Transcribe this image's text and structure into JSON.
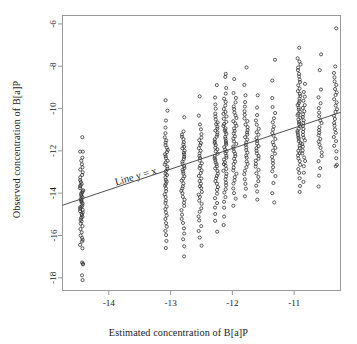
{
  "figure": {
    "background": "#ffffff",
    "frame_color": "#9a9a9a",
    "point_color": "#2a2a2a",
    "line_color": "#3d3d3d",
    "text_color": "#1b1b1b"
  },
  "chart_data": {
    "type": "scatter",
    "title": "",
    "xlabel": "Estimated concentration of B[a]P",
    "ylabel": "Observed concentration of B[a]P",
    "xlim": [
      -14.75,
      -10.25
    ],
    "ylim": [
      -18.6,
      -5.6
    ],
    "xticks": [
      -14,
      -13,
      -12,
      -11
    ],
    "xticklabels": [
      "-14",
      "-13",
      "-12",
      "-11"
    ],
    "yticks": [
      -6,
      -8,
      -10,
      -12,
      -14,
      -16,
      -18
    ],
    "yticklabels": [
      "-6",
      "-8",
      "-10",
      "-12",
      "-14",
      "-16",
      "-18"
    ],
    "grid": false,
    "legend": null,
    "marker": "open-circle",
    "marker_size_px": 3.0,
    "annotations": [
      {
        "text": "Line y = x",
        "x": -13.55,
        "y": -13.35,
        "rotation_deg": -16
      }
    ],
    "reference_line": {
      "label": "Line y = x",
      "x0": -14.75,
      "y0": -14.57,
      "x1": -10.25,
      "y1": -10.18,
      "style": "solid",
      "width_px": 0.9
    },
    "series": [
      {
        "name": "observations",
        "columns": [
          {
            "x": -14.44,
            "values": [
              -11.34,
              -12.02,
              -12.05,
              -12.32,
              -12.46,
              -12.62,
              -12.78,
              -12.9,
              -13.02,
              -13.14,
              -13.26,
              -13.36,
              -13.46,
              -13.55,
              -13.62,
              -13.7,
              -13.78,
              -13.84,
              -13.9,
              -13.96,
              -14.02,
              -14.08,
              -14.14,
              -14.2,
              -14.26,
              -14.32,
              -14.38,
              -14.44,
              -14.5,
              -14.56,
              -14.62,
              -14.68,
              -14.74,
              -14.8,
              -14.86,
              -14.92,
              -14.98,
              -15.04,
              -15.1,
              -15.18,
              -15.26,
              -15.34,
              -15.44,
              -15.56,
              -15.7,
              -15.86,
              -16.0,
              -16.12,
              -16.2,
              -16.3,
              -16.44,
              -16.62,
              -17.26,
              -17.32,
              -17.38,
              -17.9,
              -18.1
            ]
          },
          {
            "x": -13.07,
            "values": [
              -9.62,
              -10.1,
              -10.58,
              -10.92,
              -11.16,
              -11.34,
              -11.5,
              -11.62,
              -11.74,
              -11.86,
              -11.96,
              -12.06,
              -12.16,
              -12.26,
              -12.36,
              -12.46,
              -12.56,
              -12.66,
              -12.76,
              -12.86,
              -12.96,
              -13.06,
              -13.16,
              -13.26,
              -13.36,
              -13.46,
              -13.56,
              -13.66,
              -13.78,
              -13.92,
              -14.06,
              -14.2,
              -14.34,
              -14.48,
              -14.62,
              -14.76,
              -14.9,
              -15.06,
              -15.22,
              -15.4,
              -15.58,
              -15.78,
              -16.0,
              -16.26,
              -16.6
            ]
          },
          {
            "x": -12.8,
            "values": [
              -10.42,
              -11.1,
              -11.22,
              -11.34,
              -11.46,
              -11.58,
              -11.7,
              -11.8,
              -11.9,
              -12.0,
              -12.1,
              -12.2,
              -12.3,
              -12.4,
              -12.5,
              -12.6,
              -12.7,
              -12.8,
              -12.9,
              -13.0,
              -13.1,
              -13.2,
              -13.3,
              -13.42,
              -13.54,
              -13.66,
              -13.78,
              -13.9,
              -14.02,
              -14.16,
              -14.3,
              -14.46,
              -14.62,
              -14.8,
              -15.0,
              -15.2,
              -15.42,
              -15.66,
              -15.9,
              -16.16,
              -16.5,
              -17.0
            ]
          },
          {
            "x": -12.52,
            "values": [
              -9.42,
              -10.34,
              -10.74,
              -11.0,
              -11.2,
              -11.36,
              -11.5,
              -11.62,
              -11.74,
              -11.86,
              -11.98,
              -12.1,
              -12.22,
              -12.34,
              -12.46,
              -12.58,
              -12.7,
              -12.82,
              -12.94,
              -13.06,
              -13.18,
              -13.3,
              -13.42,
              -13.54,
              -13.66,
              -13.78,
              -13.92,
              -14.06,
              -14.2,
              -14.36,
              -14.52,
              -14.7,
              -14.9,
              -15.1,
              -15.3,
              -15.54,
              -15.8,
              -16.1,
              -16.46
            ]
          },
          {
            "x": -12.26,
            "values": [
              -8.9,
              -9.5,
              -9.82,
              -10.02,
              -10.22,
              -10.38,
              -10.52,
              -10.64,
              -10.74,
              -10.84,
              -10.94,
              -11.04,
              -11.14,
              -11.24,
              -11.34,
              -11.44,
              -11.54,
              -11.64,
              -11.74,
              -11.84,
              -11.94,
              -12.04,
              -12.14,
              -12.24,
              -12.34,
              -12.44,
              -12.54,
              -12.64,
              -12.74,
              -12.84,
              -12.94,
              -13.06,
              -13.18,
              -13.3,
              -13.42,
              -13.56,
              -13.7,
              -13.86,
              -14.04,
              -14.24,
              -14.46,
              -14.7,
              -14.98,
              -15.32,
              -15.8
            ]
          },
          {
            "x": -12.12,
            "values": [
              -8.34,
              -8.5,
              -9.04,
              -9.3,
              -9.52,
              -9.7,
              -9.86,
              -10.0,
              -10.14,
              -10.26,
              -10.38,
              -10.5,
              -10.62,
              -10.72,
              -10.82,
              -10.92,
              -11.02,
              -11.12,
              -11.22,
              -11.32,
              -11.42,
              -11.52,
              -11.62,
              -11.72,
              -11.82,
              -11.92,
              -12.02,
              -12.12,
              -12.22,
              -12.32,
              -12.42,
              -12.52,
              -12.62,
              -12.72,
              -12.84,
              -12.96,
              -13.08,
              -13.2,
              -13.34,
              -13.48,
              -13.64,
              -13.8,
              -13.98,
              -14.18,
              -14.4,
              -14.68,
              -15.1,
              -15.5
            ]
          },
          {
            "x": -11.96,
            "values": [
              -8.62,
              -9.26,
              -9.5,
              -9.7,
              -9.88,
              -10.04,
              -10.18,
              -10.32,
              -10.46,
              -10.58,
              -10.7,
              -10.82,
              -10.94,
              -11.06,
              -11.18,
              -11.3,
              -11.42,
              -11.54,
              -11.66,
              -11.78,
              -11.9,
              -12.02,
              -12.14,
              -12.26,
              -12.38,
              -12.5,
              -12.64,
              -12.78,
              -12.92,
              -13.06,
              -13.22,
              -13.38,
              -13.56,
              -13.76,
              -13.98,
              -14.24,
              -14.6
            ]
          },
          {
            "x": -11.78,
            "values": [
              -8.04,
              -8.88,
              -9.36,
              -9.68,
              -9.92,
              -10.12,
              -10.3,
              -10.46,
              -10.6,
              -10.74,
              -10.88,
              -11.0,
              -11.12,
              -11.24,
              -11.36,
              -11.48,
              -11.6,
              -11.72,
              -11.84,
              -11.96,
              -12.08,
              -12.2,
              -12.34,
              -12.48,
              -12.62,
              -12.78,
              -12.94,
              -13.12,
              -13.32,
              -13.54,
              -13.8,
              -14.14
            ]
          },
          {
            "x": -11.6,
            "values": [
              -9.38,
              -9.96,
              -10.3,
              -10.56,
              -10.76,
              -10.94,
              -11.1,
              -11.24,
              -11.38,
              -11.52,
              -11.64,
              -11.76,
              -11.88,
              -12.0,
              -12.12,
              -12.24,
              -12.36,
              -12.48,
              -12.62,
              -12.76,
              -12.9,
              -13.06,
              -13.22,
              -13.42,
              -13.64,
              -13.92,
              -14.3
            ]
          },
          {
            "x": -11.33,
            "values": [
              -7.7,
              -8.66,
              -9.5,
              -9.92,
              -10.22,
              -10.46,
              -10.66,
              -10.84,
              -11.0,
              -11.16,
              -11.3,
              -11.44,
              -11.58,
              -11.72,
              -11.86,
              -12.0,
              -12.14,
              -12.28,
              -12.44,
              -12.6,
              -12.78,
              -12.98,
              -13.2,
              -13.5,
              -14.02,
              -14.42
            ]
          },
          {
            "x": -10.92,
            "values": [
              -7.12,
              -7.62,
              -7.78,
              -7.92,
              -8.06,
              -8.2,
              -8.34,
              -8.48,
              -8.62,
              -8.76,
              -8.9,
              -9.04,
              -9.18,
              -9.3,
              -9.42,
              -9.54,
              -9.64,
              -9.74,
              -9.84,
              -9.94,
              -10.04,
              -10.14,
              -10.24,
              -10.34,
              -10.44,
              -10.54,
              -10.64,
              -10.74,
              -10.84,
              -10.94,
              -11.04,
              -11.14,
              -11.24,
              -11.34,
              -11.44,
              -11.54,
              -11.64,
              -11.74,
              -11.86,
              -11.98,
              -12.1,
              -12.22,
              -12.36,
              -12.5,
              -12.66,
              -12.84,
              -13.04,
              -13.3,
              -13.66,
              -13.92
            ]
          },
          {
            "x": -10.85,
            "values": [
              -8.84,
              -9.2,
              -9.44,
              -9.64,
              -9.82,
              -9.98,
              -10.12,
              -10.26,
              -10.4,
              -10.54,
              -10.68,
              -10.82,
              -10.96,
              -11.1,
              -11.24,
              -11.38,
              -11.52,
              -11.66,
              -11.8,
              -11.96,
              -12.12,
              -12.3,
              -12.5,
              -12.74,
              -13.04,
              -13.46
            ]
          },
          {
            "x": -10.58,
            "values": [
              -7.42,
              -8.18,
              -9.08,
              -9.46,
              -9.74,
              -9.98,
              -10.18,
              -10.36,
              -10.54,
              -10.7,
              -10.86,
              -11.0,
              -11.14,
              -11.28,
              -11.42,
              -11.56,
              -11.72,
              -11.88,
              -12.06,
              -12.26,
              -12.5,
              -12.82,
              -13.18,
              -13.7
            ]
          },
          {
            "x": -10.33,
            "values": [
              -6.22,
              -8.0,
              -8.3,
              -8.52,
              -8.72,
              -8.9,
              -9.06,
              -9.22,
              -9.38,
              -9.54,
              -9.7,
              -9.86,
              -10.02,
              -10.18,
              -10.34,
              -10.5,
              -10.66,
              -10.82,
              -10.98,
              -11.16,
              -11.34,
              -11.54,
              -11.76,
              -12.02,
              -12.36,
              -12.64,
              -12.74
            ]
          }
        ]
      }
    ]
  },
  "axes": {
    "x_title": "Estimated concentration of B[a]P",
    "y_title": "Observed concentration of B[a]P"
  }
}
